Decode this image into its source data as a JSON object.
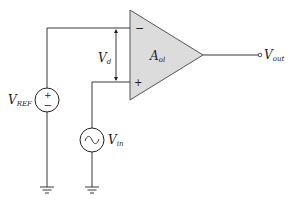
{
  "diagram": {
    "opamp": {
      "gain_label": "A",
      "gain_sub": "ol",
      "minus_sign": "−",
      "plus_sign": "+",
      "fill": "#dcdcdc"
    },
    "diff_voltage": {
      "label": "V",
      "sub": "d"
    },
    "vref": {
      "label": "V",
      "sub": "REF",
      "plus": "+",
      "minus": "−"
    },
    "vin": {
      "label": "V",
      "sub": "in",
      "glyph": "~"
    },
    "vout": {
      "label": "V",
      "sub": "out"
    },
    "colors": {
      "line": "#222222",
      "opamp_fill": "#dcdcdc"
    }
  }
}
